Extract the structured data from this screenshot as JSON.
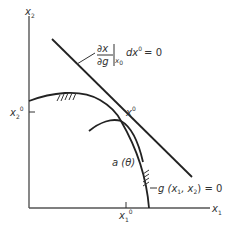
{
  "diagram": {
    "axes": {
      "x_label": "x",
      "x_label_sub": "1",
      "y_label": "x",
      "y_label_sub": "2"
    },
    "ticks": {
      "x1_0_label": "x",
      "x1_0_sub": "1",
      "x1_0_sup": "0",
      "x2_0_label": "x",
      "x2_0_sub": "2",
      "x2_0_sup": "0"
    },
    "point": {
      "label": "x",
      "sup": "0"
    },
    "tangent_annotation": {
      "numerator": "∂x",
      "denominator": "∂g",
      "eval_sub": "x",
      "eval_sub_sub": "0",
      "term": "dx",
      "term_sup": "0",
      "equals": "= 0"
    },
    "curve_a_label": "a (θ)",
    "constraint_label": "g (x",
    "constraint_sub1": "1",
    "constraint_mid": ", x",
    "constraint_sub2": "2",
    "constraint_end": ") = 0",
    "colors": {
      "line": "#222222",
      "axis": "#555555",
      "text": "#333333"
    }
  }
}
